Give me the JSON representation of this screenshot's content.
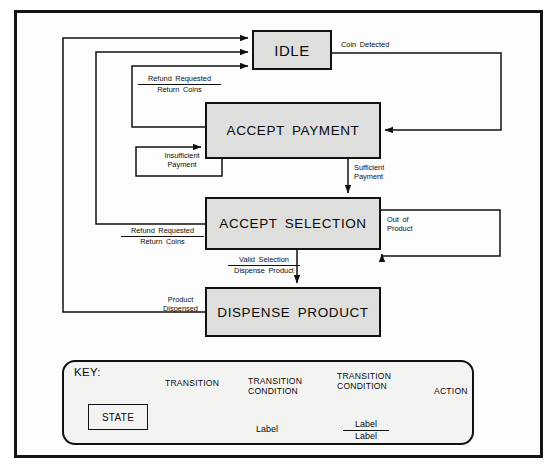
{
  "figure": {
    "caption": "",
    "frame_color": "#141414",
    "state_fill": "#dededd",
    "line_color": "#111111"
  },
  "states": [
    {
      "id": "idle",
      "label": "IDLE"
    },
    {
      "id": "accept_payment",
      "label": "ACCEPT PAYMENT"
    },
    {
      "id": "accept_selection",
      "label": "ACCEPT SELECTION"
    },
    {
      "id": "dispense_product",
      "label": "DISPENSE PRODUCT"
    }
  ],
  "transitions": [
    {
      "id": "coin_detected",
      "from": "IDLE",
      "to": "ACCEPT PAYMENT",
      "condition": "Coin Detected",
      "action": ""
    },
    {
      "id": "refund_from_payment",
      "from": "ACCEPT PAYMENT",
      "to": "IDLE",
      "condition": "Refund Requested",
      "action": "Return Coins"
    },
    {
      "id": "insufficient_payment",
      "from": "ACCEPT PAYMENT",
      "to": "ACCEPT PAYMENT",
      "condition": "Insufficient",
      "condition_line2": "Payment",
      "action": ""
    },
    {
      "id": "sufficient_payment",
      "from": "ACCEPT PAYMENT",
      "to": "ACCEPT SELECTION",
      "condition": "Sufficient",
      "condition_line2": "Payment",
      "action": ""
    },
    {
      "id": "refund_from_selection",
      "from": "ACCEPT SELECTION",
      "to": "IDLE",
      "condition": "Refund Requested",
      "action": "Return Coins"
    },
    {
      "id": "out_of_product",
      "from": "ACCEPT SELECTION",
      "to": "ACCEPT SELECTION",
      "condition": "Out of",
      "condition_line2": "Product",
      "action": ""
    },
    {
      "id": "valid_selection",
      "from": "ACCEPT SELECTION",
      "to": "DISPENSE PRODUCT",
      "condition": "Valid Selection",
      "action": "Dispense Product"
    },
    {
      "id": "product_dispensed",
      "from": "DISPENSE PRODUCT",
      "to": "IDLE",
      "condition": "Product",
      "condition_line2": "Dispensed",
      "action": ""
    }
  ],
  "labels": {
    "coin_detected": "Coin Detected",
    "refund_requested_1": "Refund Requested",
    "return_coins_1": "Return Coins",
    "insufficient_1": "Insufficient",
    "insufficient_2": "Payment",
    "sufficient_1": "Sufficient",
    "sufficient_2": "Payment",
    "refund_requested_2": "Refund Requested",
    "return_coins_2": "Return Coins",
    "out_of_1": "Out of",
    "out_of_2": "Product",
    "valid_selection": "Valid Selection",
    "dispense_product": "Dispense Product",
    "product_1": "Product",
    "product_2": "Dispensed"
  },
  "key": {
    "title": "KEY:",
    "state_label": "STATE",
    "transition_caption": "TRANSITION",
    "transition_condition_caption_line1": "TRANSITION",
    "transition_condition_caption_line2": "CONDITION",
    "transition_condition_caption2_line1": "TRANSITION",
    "transition_condition_caption2_line2": "CONDITION",
    "action_caption": "ACTION",
    "sample_label_1": "Label",
    "sample_label_2": "Label",
    "sample_label_3": "Label"
  }
}
